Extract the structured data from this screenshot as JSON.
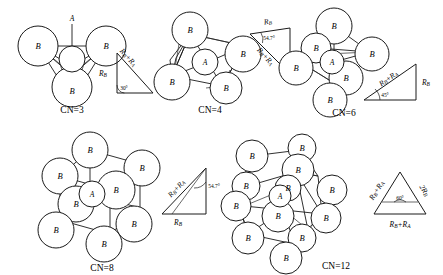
{
  "diagram": {
    "center_atom_label": "A",
    "ligand_atom_label": "B",
    "background": "#ffffff",
    "line_color": "#1a1a1a"
  },
  "figures": [
    {
      "id": "cn3",
      "cn_label": "CN=3",
      "geometry": "triangular planar",
      "center_label": "A",
      "ligand_label": "B",
      "ligand_count": 3,
      "triangle": {
        "kind": "right",
        "angle_label": "30°",
        "side_vertical": "R",
        "side_vertical_sub": "B",
        "side_hyp_a": "R",
        "side_hyp_a_sub": "B",
        "side_hyp_op": "+",
        "side_hyp_b": "R",
        "side_hyp_b_sub": "A"
      }
    },
    {
      "id": "cn4",
      "cn_label": "CN=4",
      "geometry": "tetrahedral",
      "center_label": "A",
      "ligand_label": "B",
      "ligand_count": 4,
      "triangle": {
        "kind": "right",
        "angle_label": "54.7°",
        "side_top": "R",
        "side_top_sub": "B",
        "side_hyp_a": "R",
        "side_hyp_a_sub": "B",
        "side_hyp_op": "+",
        "side_hyp_b": "R",
        "side_hyp_b_sub": "A"
      }
    },
    {
      "id": "cn6",
      "cn_label": "CN=6",
      "geometry": "octahedral",
      "center_label": "A",
      "ligand_label": "B",
      "ligand_count": 6,
      "triangle": {
        "kind": "right",
        "angle_label": "45°",
        "side_vertical": "R",
        "side_vertical_sub": "B",
        "side_hyp_a": "R",
        "side_hyp_a_sub": "B",
        "side_hyp_op": "+",
        "side_hyp_b": "R",
        "side_hyp_b_sub": "A"
      }
    },
    {
      "id": "cn8",
      "cn_label": "CN=8",
      "geometry": "cubic",
      "center_label": "A",
      "ligand_label": "B",
      "ligand_count": 8,
      "triangle": {
        "kind": "right",
        "angle_label": "54.7°",
        "side_base": "R",
        "side_base_sub": "B",
        "side_hyp_a": "R",
        "side_hyp_a_sub": "B",
        "side_hyp_op": "+",
        "side_hyp_b": "R",
        "side_hyp_b_sub": "A"
      }
    },
    {
      "id": "cn12",
      "cn_label": "CN=12",
      "geometry": "cuboctahedral",
      "center_label": "A",
      "ligand_label": "B",
      "ligand_count": 12,
      "triangle": {
        "kind": "equilateral",
        "angle_label": "60°",
        "side_left_a": "R",
        "side_left_a_sub": "B",
        "side_left_op": "+",
        "side_left_b": "R",
        "side_left_b_sub": "A",
        "side_right_coef": "2",
        "side_right": "R",
        "side_right_sub": "B",
        "side_base_a": "R",
        "side_base_a_sub": "B",
        "side_base_op": "+",
        "side_base_b": "R",
        "side_base_b_sub": "A"
      }
    }
  ]
}
